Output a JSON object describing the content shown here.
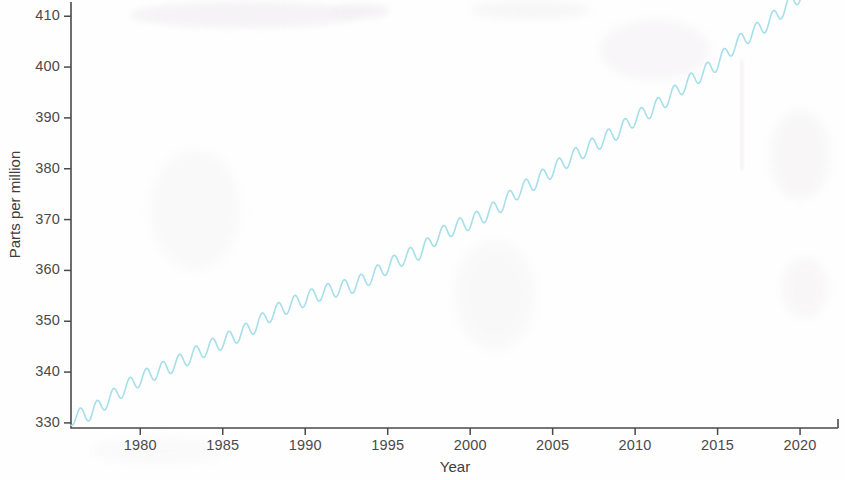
{
  "figure": {
    "background_color": "#fefefe",
    "axis_color": "#4a4a4a",
    "line_color": "#a5dfea"
  },
  "axes": {
    "x_label": "Year",
    "y_label": "Parts per million",
    "x_ticks": [
      "1980",
      "1985",
      "1990",
      "1995",
      "2000",
      "2005",
      "2010",
      "2015",
      "2020"
    ],
    "y_ticks": [
      "330",
      "340",
      "350",
      "360",
      "370",
      "380",
      "390",
      "400",
      "410"
    ]
  },
  "chart_data": {
    "type": "line",
    "title": "",
    "subtitle": "",
    "xlabel": "Year",
    "ylabel": "Parts per million",
    "xlim": [
      1975.8,
      2022.3
    ],
    "ylim": [
      329.0,
      412.8
    ],
    "xticks": [
      1980,
      1985,
      1990,
      1995,
      2000,
      2005,
      2010,
      2015,
      2020
    ],
    "yticks": [
      330,
      340,
      350,
      360,
      370,
      380,
      390,
      400,
      410
    ],
    "grid": false,
    "legend": null,
    "legend_position": "none",
    "annotations": [],
    "series": [
      {
        "name": "Atmospheric CO2 concentration",
        "color": "#a5dfea",
        "line_width": 1.6,
        "description": "Monthly mean CO2 with annual seasonal oscillation of about 3 ppm peak-to-peak superimposed on a rising, slightly accelerating trend (Keeling Curve).",
        "seasonal_amplitude_ppm": 3.0,
        "seasonal_peak_month": "May",
        "seasonal_trough_month": "September",
        "x": [
          1976.0,
          1977.0,
          1978.0,
          1979.0,
          1980.0,
          1981.0,
          1982.0,
          1983.0,
          1984.0,
          1985.0,
          1986.0,
          1987.0,
          1988.0,
          1989.0,
          1990.0,
          1991.0,
          1992.0,
          1993.0,
          1994.0,
          1995.0,
          1996.0,
          1997.0,
          1998.0,
          1999.0,
          2000.0,
          2001.0,
          2002.0,
          2003.0,
          2004.0,
          2005.0,
          2006.0,
          2007.0,
          2008.0,
          2009.0,
          2010.0,
          2011.0,
          2012.0,
          2013.0,
          2014.0,
          2015.0,
          2016.0,
          2017.0,
          2018.0,
          2019.0,
          2020.0,
          2021.0,
          2022.0
        ],
        "values": [
          331.1,
          332.0,
          334.4,
          336.7,
          338.7,
          340.1,
          341.4,
          343.0,
          344.6,
          346.0,
          347.4,
          349.2,
          351.6,
          353.1,
          354.4,
          355.6,
          356.4,
          357.1,
          358.8,
          360.8,
          362.6,
          363.7,
          366.7,
          368.4,
          369.5,
          371.1,
          373.2,
          375.8,
          377.5,
          379.8,
          381.9,
          383.8,
          385.6,
          387.4,
          389.9,
          391.6,
          393.9,
          396.5,
          398.6,
          400.8,
          404.2,
          406.5,
          408.5,
          411.4,
          414.2,
          416.4,
          418.5
        ]
      }
    ]
  }
}
